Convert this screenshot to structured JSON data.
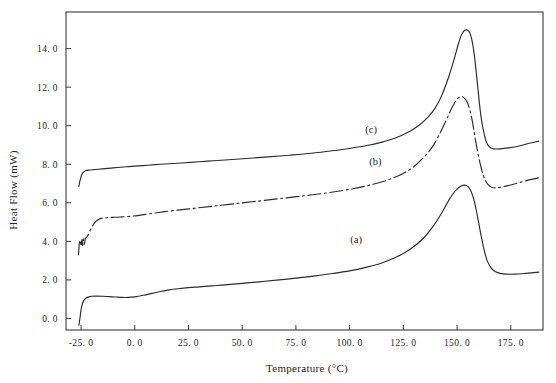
{
  "chart_data": {
    "type": "line",
    "title": "",
    "xlabel": "Temperature (°C)",
    "ylabel": "Heat Flow (mW)",
    "xlim": [
      -32.0,
      190.0
    ],
    "ylim": [
      -0.6,
      15.9
    ],
    "grid": false,
    "legend_position": "inline-annotations",
    "xticks": [
      -25.0,
      0.0,
      25.0,
      50.0,
      75.0,
      100.0,
      125.0,
      150.0,
      175.0
    ],
    "xtick_labels": [
      "-25. 0",
      "0. 0",
      "25. 0",
      "50. 0",
      "75. 0",
      "100. 0",
      "125. 0",
      "150. 0",
      "175. 0"
    ],
    "yticks": [
      0.0,
      2.0,
      4.0,
      6.0,
      8.0,
      10.0,
      12.0,
      14.0
    ],
    "ytick_labels": [
      "0. 0",
      "2. 0",
      "4. 0",
      "6. 0",
      "8. 0",
      "10. 0",
      "12. 0",
      "14. 0"
    ],
    "annotations": [
      {
        "text": "(a)",
        "x": 103.0,
        "y": 3.9
      },
      {
        "text": "(b)",
        "x": 112.0,
        "y": 7.95
      },
      {
        "text": "(c)",
        "x": 110.0,
        "y": 9.6
      }
    ],
    "series": [
      {
        "name": "(a)",
        "style": "solid",
        "color": "#2b2b2b",
        "x": [
          -26.0,
          -25.4,
          -25.0,
          -24.4,
          -23.6,
          -22.6,
          -21.4,
          -20.0,
          -18.0,
          -15.0,
          -12.0,
          -9.0,
          -6.0,
          -3.0,
          0.0,
          4.0,
          8.0,
          12.0,
          16.0,
          20.0,
          25.0,
          30.0,
          36.0,
          42.0,
          50.0,
          58.0,
          66.0,
          75.0,
          84.0,
          92.0,
          100.0,
          108.0,
          115.0,
          122.0,
          128.0,
          134.0,
          139.0,
          143.0,
          146.0,
          149.0,
          151.5,
          153.5,
          155.0,
          156.5,
          158.0,
          159.5,
          161.0,
          162.5,
          164.0,
          166.0,
          168.0,
          170.0,
          173.0,
          177.0,
          182.0,
          188.0
        ],
        "y": [
          -0.35,
          0.1,
          0.45,
          0.75,
          0.95,
          1.06,
          1.12,
          1.15,
          1.16,
          1.15,
          1.13,
          1.11,
          1.09,
          1.09,
          1.12,
          1.2,
          1.3,
          1.4,
          1.48,
          1.54,
          1.6,
          1.64,
          1.69,
          1.74,
          1.82,
          1.9,
          1.99,
          2.09,
          2.21,
          2.33,
          2.47,
          2.66,
          2.88,
          3.2,
          3.58,
          4.12,
          4.8,
          5.5,
          6.1,
          6.6,
          6.85,
          6.92,
          6.85,
          6.6,
          6.1,
          5.3,
          4.4,
          3.6,
          3.0,
          2.6,
          2.42,
          2.34,
          2.3,
          2.3,
          2.34,
          2.4
        ]
      },
      {
        "name": "(b)",
        "style": "dash-dot",
        "color": "#2b2b2b",
        "x": [
          -26.2,
          -25.8,
          -25.4,
          -25.0,
          -24.6,
          -24.2,
          -23.8,
          -23.4,
          -23.0,
          -22.4,
          -21.6,
          -20.6,
          -19.4,
          -18.0,
          -16.0,
          -14.0,
          -12.0,
          -9.0,
          -6.0,
          -2.0,
          2.0,
          8.0,
          14.0,
          20.0,
          28.0,
          36.0,
          44.0,
          52.0,
          60.0,
          70.0,
          80.0,
          90.0,
          100.0,
          108.0,
          116.0,
          123.0,
          129.0,
          134.0,
          138.5,
          142.0,
          145.0,
          147.5,
          149.5,
          151.0,
          152.5,
          154.0,
          155.5,
          157.0,
          158.5,
          160.0,
          161.5,
          163.0,
          165.0,
          167.0,
          170.0,
          174.0,
          179.0,
          184.0,
          188.0
        ],
        "y": [
          3.3,
          3.9,
          4.05,
          3.75,
          4.1,
          3.78,
          4.12,
          3.85,
          4.15,
          4.2,
          4.35,
          4.6,
          4.85,
          5.05,
          5.18,
          5.22,
          5.24,
          5.25,
          5.27,
          5.3,
          5.35,
          5.45,
          5.54,
          5.62,
          5.72,
          5.82,
          5.92,
          6.02,
          6.12,
          6.25,
          6.38,
          6.52,
          6.7,
          6.88,
          7.12,
          7.42,
          7.8,
          8.3,
          8.9,
          9.6,
          10.3,
          10.9,
          11.3,
          11.48,
          11.5,
          11.35,
          11.0,
          10.3,
          9.3,
          8.4,
          7.7,
          7.2,
          6.88,
          6.78,
          6.8,
          6.9,
          7.05,
          7.2,
          7.3
        ]
      },
      {
        "name": "(c)",
        "style": "solid",
        "color": "#2b2b2b",
        "x": [
          -26.0,
          -25.6,
          -25.2,
          -24.8,
          -24.2,
          -23.4,
          -22.4,
          -21.0,
          -19.0,
          -17.0,
          -14.0,
          -11.0,
          -8.0,
          -4.0,
          0.0,
          6.0,
          12.0,
          18.0,
          26.0,
          34.0,
          42.0,
          52.0,
          62.0,
          72.0,
          82.0,
          92.0,
          100.0,
          108.0,
          115.0,
          121.0,
          127.0,
          132.0,
          136.5,
          140.0,
          143.0,
          146.0,
          148.5,
          150.5,
          152.0,
          153.5,
          155.0,
          156.0,
          157.0,
          158.0,
          159.0,
          160.0,
          161.0,
          162.0,
          163.5,
          165.0,
          167.0,
          170.0,
          174.0,
          179.0,
          184.0,
          188.0
        ],
        "y": [
          6.85,
          7.1,
          7.25,
          7.42,
          7.55,
          7.63,
          7.68,
          7.7,
          7.72,
          7.74,
          7.77,
          7.8,
          7.83,
          7.87,
          7.9,
          7.95,
          8.0,
          8.04,
          8.1,
          8.16,
          8.22,
          8.3,
          8.38,
          8.47,
          8.57,
          8.7,
          8.82,
          8.97,
          9.15,
          9.35,
          9.65,
          10.0,
          10.45,
          10.95,
          11.6,
          12.5,
          13.4,
          14.2,
          14.7,
          14.95,
          14.95,
          14.8,
          14.4,
          13.7,
          12.7,
          11.6,
          10.6,
          9.9,
          9.2,
          8.9,
          8.8,
          8.8,
          8.85,
          8.95,
          9.1,
          9.2
        ]
      }
    ]
  }
}
